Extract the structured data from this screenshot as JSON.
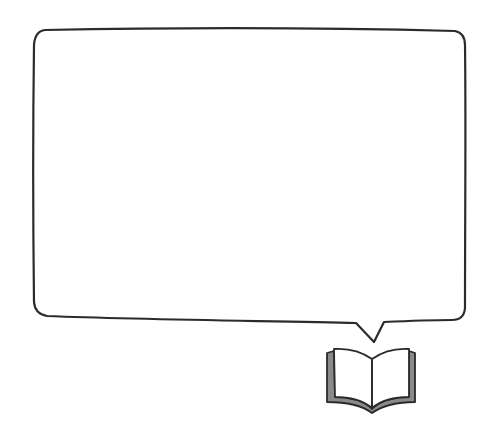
{
  "scene": {
    "background": "#ffffff",
    "stroke_color": "#2b2b2b",
    "cover_color": "#8a8a8a",
    "page_color": "#ffffff"
  },
  "speech_bubble": {
    "text": "",
    "x": 33,
    "y": 28,
    "width": 433,
    "height": 295,
    "tail_tip": [
      374,
      343
    ]
  },
  "icon": {
    "name": "open-book-icon"
  }
}
